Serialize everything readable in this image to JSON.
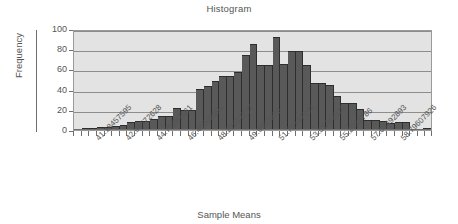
{
  "chart": {
    "title": "Histogram",
    "xlabel": "Sample Means",
    "ylabel": "Frequency"
  },
  "axes": {
    "y_ticks": [
      "0",
      "20",
      "40",
      "60",
      "80",
      "100"
    ]
  },
  "chart_data": {
    "type": "bar",
    "title": "Histogram",
    "xlabel": "Sample Means",
    "ylabel": "Frequency",
    "ylim": [
      0,
      100
    ],
    "grid": true,
    "legend": null,
    "bin_width": 0.44028758,
    "categories": [
      "40.30400078",
      "40.74428837",
      "41.18457595",
      "41.62486354",
      "42.06515112",
      "42.50543871",
      "42.94572628",
      "43.38601387",
      "43.82630145",
      "44.26658904",
      "44.70687661",
      "45.1471642",
      "45.58745178",
      "46.02773937",
      "46.46802694",
      "46.90831453",
      "47.34860211",
      "47.7888897",
      "48.22917727",
      "48.66946486",
      "49.10975244",
      "49.55004003",
      "49.9903276",
      "50.43061519",
      "50.87090277",
      "51.31119036",
      "51.75147793",
      "52.19176552",
      "52.6320531",
      "53.07234069",
      "53.51262826",
      "53.95291585",
      "54.39320343",
      "54.83349102",
      "55.2737786",
      "55.71406619",
      "56.15435377",
      "56.59464136",
      "57.03492893",
      "57.47521652",
      "57.9155041",
      "58.35579169",
      "58.79607926",
      "59.23636685",
      "59.67665443",
      "60.11694202",
      "60.55722959"
    ],
    "values": [
      1,
      2,
      2,
      3,
      3,
      4,
      5,
      8,
      9,
      9,
      11,
      14,
      14,
      22,
      20,
      20,
      41,
      44,
      49,
      53,
      53,
      57,
      74,
      85,
      64,
      64,
      92,
      65,
      78,
      78,
      64,
      47,
      47,
      45,
      34,
      27,
      27,
      21,
      10,
      10,
      9,
      7,
      8,
      8,
      0,
      0,
      2
    ],
    "tick_labels": [
      "41.18457595",
      "42.94572628",
      "44.70687661",
      "46.46802694",
      "48.22917727",
      "49.9903276",
      "51.75147793",
      "53.51262826",
      "55.2737786",
      "57.03492893",
      "58.79607926"
    ],
    "tick_label_indices": [
      2,
      6,
      10,
      14,
      18,
      22,
      26,
      30,
      34,
      38,
      42
    ]
  },
  "colors": {
    "bar": "#595959",
    "bar_edge": "#2e2e2e",
    "plot_background": "#e3e3e3",
    "gridline": "#8d8d8d",
    "axis": "#6f6f6f",
    "text": "#555555",
    "page_background": "#ffffff"
  }
}
